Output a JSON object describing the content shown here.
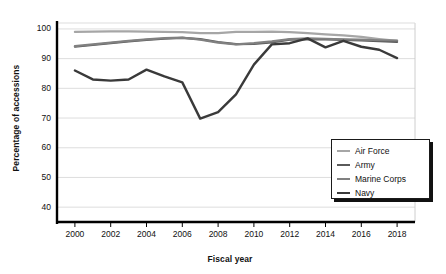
{
  "chart_data": {
    "type": "line",
    "title": "",
    "xlabel": "Fiscal year",
    "ylabel": "Percentage of accessions",
    "x": [
      2000,
      2001,
      2002,
      2003,
      2004,
      2005,
      2006,
      2007,
      2008,
      2009,
      2010,
      2011,
      2012,
      2013,
      2014,
      2015,
      2016,
      2017,
      2018
    ],
    "xlim": [
      1999,
      2019
    ],
    "ylim": [
      35,
      102
    ],
    "xticks": [
      "2000",
      "2002",
      "2004",
      "2006",
      "2008",
      "2010",
      "2012",
      "2014",
      "2016",
      "2018"
    ],
    "xtick_values": [
      2000,
      2002,
      2004,
      2006,
      2008,
      2010,
      2012,
      2014,
      2016,
      2018
    ],
    "yticks": [
      "40",
      "50",
      "60",
      "70",
      "80",
      "90",
      "100"
    ],
    "ytick_values": [
      40,
      50,
      60,
      70,
      80,
      90,
      100
    ],
    "grid": "horizontal",
    "legend_position": "bottom-right",
    "series": [
      {
        "name": "Air Force",
        "color": "#a6a6a6",
        "width": 2.2,
        "values": [
          99.0,
          99.1,
          99.2,
          99.2,
          99.1,
          99.0,
          98.9,
          98.6,
          98.6,
          99.0,
          99.0,
          99.1,
          98.9,
          98.6,
          98.2,
          97.8,
          97.3,
          96.6,
          96.0
        ]
      },
      {
        "name": "Army",
        "color": "#5a5a5a",
        "width": 2.2,
        "values": [
          94.0,
          94.6,
          95.2,
          95.8,
          96.3,
          96.7,
          97.0,
          96.6,
          95.6,
          94.9,
          95.0,
          95.5,
          96.4,
          96.6,
          96.5,
          96.3,
          96.1,
          95.9,
          95.6
        ]
      },
      {
        "name": "Marine Corps",
        "color": "#808080",
        "width": 2.2,
        "values": [
          94.2,
          94.8,
          95.4,
          96.0,
          96.5,
          96.9,
          97.1,
          96.4,
          95.4,
          94.8,
          95.2,
          95.8,
          96.6,
          96.8,
          96.7,
          96.5,
          96.4,
          96.2,
          96.1
        ]
      },
      {
        "name": "Navy",
        "color": "#3a3a3a",
        "width": 2.4,
        "values": [
          86.0,
          83.0,
          82.6,
          83.0,
          86.3,
          84.0,
          82.0,
          69.8,
          72.0,
          78.0,
          88.0,
          94.8,
          95.2,
          96.8,
          93.8,
          96.0,
          94.0,
          93.0,
          90.2
        ]
      }
    ]
  },
  "legend": {
    "items": [
      {
        "label": "Air Force"
      },
      {
        "label": "Army"
      },
      {
        "label": "Marine Corps"
      },
      {
        "label": "Navy"
      }
    ]
  }
}
